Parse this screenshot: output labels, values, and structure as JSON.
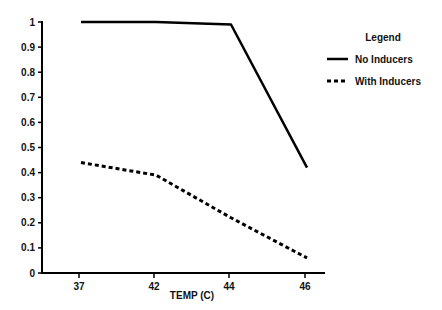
{
  "chart_data": {
    "type": "line",
    "title": "",
    "xlabel": "TEMP (C)",
    "ylabel": "",
    "categories": [
      "37",
      "42",
      "44",
      "46"
    ],
    "yticks": [
      "0",
      "0.1",
      "0.2",
      "0.3",
      "0.4",
      "0.5",
      "0.6",
      "0.7",
      "0.8",
      "0.9",
      "1"
    ],
    "ylim": [
      0,
      1
    ],
    "grid": false,
    "legend_position": "right",
    "legend_title": "Legend",
    "series": [
      {
        "name": "No Inducers",
        "style": "solid",
        "values": [
          1.0,
          1.0,
          0.99,
          0.42
        ]
      },
      {
        "name": "With Inducers",
        "style": "dashed",
        "values": [
          0.44,
          0.39,
          0.22,
          0.06
        ]
      }
    ]
  },
  "colors": {
    "line": "#000000",
    "text": "#111111",
    "background": "#ffffff"
  }
}
